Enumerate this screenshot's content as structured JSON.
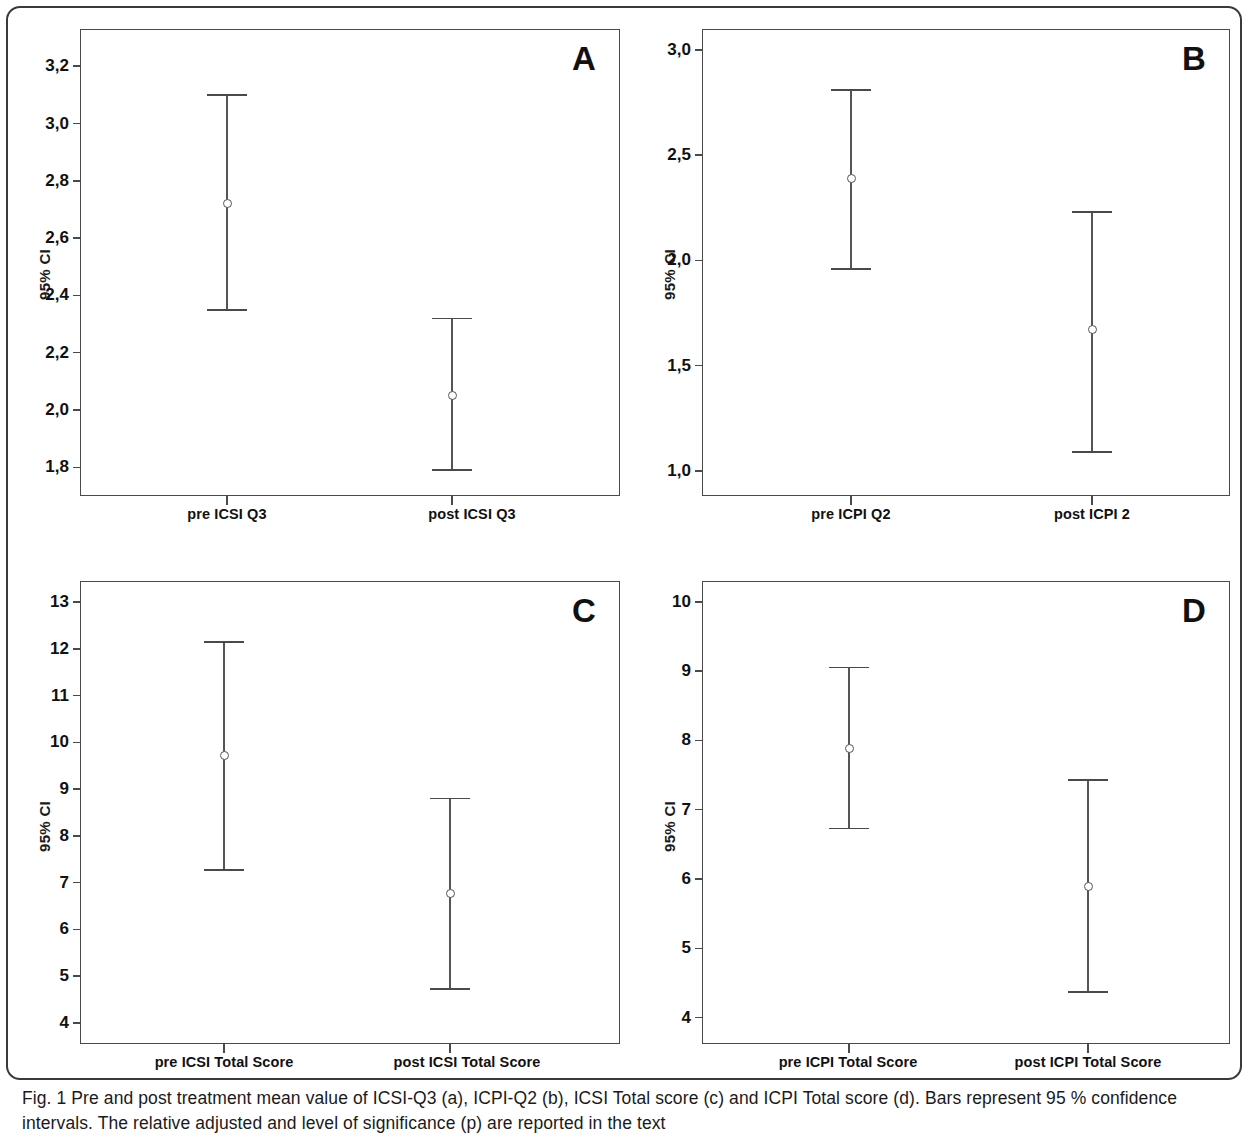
{
  "figure": {
    "caption_prefix": "Fig. 1",
    "caption_text": " Pre and post treatment mean value of ICSI-Q3 (a), ICPI-Q2 (b), ICSI Total score (c) and ICPI Total score (d). Bars represent 95 % confidence intervals. The relative adjusted and level of significance (p) are reported in the text",
    "caption_line1": "Fig. 1 Pre and post treatment mean value of ICSI-Q3 (a), ICPI-Q2 (b), ICSI Total score (c) and ICPI Total score (d). Bars represent 95 % confidence",
    "caption_line2": "intervals. The relative adjusted and level of significance (p) are reported in the text"
  },
  "chart_data": [
    {
      "panel": "A",
      "type": "scatter",
      "title": "",
      "ylabel": "95% CI",
      "xlabel": "",
      "categories": [
        "pre ICSI Q3",
        "post ICSI Q3"
      ],
      "values": [
        2.72,
        2.05
      ],
      "ci_lower": [
        2.35,
        1.79
      ],
      "ci_upper": [
        3.1,
        2.32
      ],
      "ylim": [
        1.7,
        3.33
      ],
      "yticks": [
        1.8,
        2.0,
        2.2,
        2.4,
        2.6,
        2.8,
        3.0,
        3.2
      ],
      "ytick_labels": [
        "1,8",
        "2,0",
        "2,2",
        "2,4",
        "2,6",
        "2,8",
        "3,0",
        "3,2"
      ],
      "grid": false,
      "legend": "none"
    },
    {
      "panel": "B",
      "type": "scatter",
      "title": "",
      "ylabel": "95% CI",
      "xlabel": "",
      "categories": [
        "pre ICPI Q2",
        "post ICPI 2"
      ],
      "values": [
        2.39,
        1.67
      ],
      "ci_lower": [
        1.96,
        1.09
      ],
      "ci_upper": [
        2.81,
        2.23
      ],
      "ylim": [
        0.88,
        3.1
      ],
      "yticks": [
        1.0,
        1.5,
        2.0,
        2.5,
        3.0
      ],
      "ytick_labels": [
        "1,0",
        "1,5",
        "2,0",
        "2,5",
        "3,0"
      ],
      "grid": false,
      "legend": "none"
    },
    {
      "panel": "C",
      "type": "scatter",
      "title": "",
      "ylabel": "95% CI",
      "xlabel": "",
      "categories": [
        "pre ICSI Total Score",
        "post ICSI Total Score"
      ],
      "values": [
        9.72,
        6.77
      ],
      "ci_lower": [
        7.27,
        4.73
      ],
      "ci_upper": [
        12.15,
        8.8
      ],
      "ylim": [
        3.55,
        13.45
      ],
      "yticks": [
        4,
        5,
        6,
        7,
        8,
        9,
        10,
        11,
        12,
        13
      ],
      "ytick_labels": [
        "4",
        "5",
        "6",
        "7",
        "8",
        "9",
        "10",
        "11",
        "12",
        "13"
      ],
      "grid": false,
      "legend": "none"
    },
    {
      "panel": "D",
      "type": "scatter",
      "title": "",
      "ylabel": "95% CI",
      "xlabel": "",
      "categories": [
        "pre ICPI Total Score",
        "post ICPI Total Score"
      ],
      "values": [
        7.89,
        5.89
      ],
      "ci_lower": [
        6.73,
        4.37
      ],
      "ci_upper": [
        9.05,
        7.43
      ],
      "ylim": [
        3.62,
        10.3
      ],
      "yticks": [
        4,
        5,
        6,
        7,
        8,
        9,
        10
      ],
      "ytick_labels": [
        "4",
        "5",
        "6",
        "7",
        "8",
        "9",
        "10"
      ],
      "grid": false,
      "legend": "none"
    }
  ],
  "panels": {
    "a": {
      "letter": "A",
      "ylabel": "95% CI",
      "x1": "pre ICSI Q3",
      "x2": "post ICSI Q3"
    },
    "b": {
      "letter": "B",
      "ylabel": "95% CI",
      "x1": "pre ICPI Q2",
      "x2": "post ICPI 2"
    },
    "c": {
      "letter": "C",
      "ylabel": "95% CI",
      "x1": "pre ICSI Total Score",
      "x2": "post ICSI Total Score"
    },
    "d": {
      "letter": "D",
      "ylabel": "95% CI",
      "x1": "pre ICPI Total Score",
      "x2": "post ICPI Total Score"
    }
  }
}
